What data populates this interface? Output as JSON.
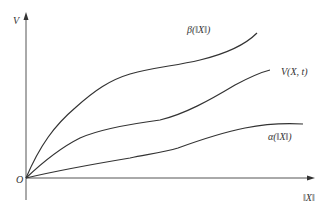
{
  "diagram": {
    "axes": {
      "y_label": "V",
      "x_label": "‖X‖",
      "origin_label": "O"
    },
    "curves": [
      {
        "name": "beta",
        "label": "β(‖X‖)",
        "description": "upper bound, concave curve rising fastest"
      },
      {
        "name": "lyapunov",
        "label": "V(X, t)",
        "description": "middle curve"
      },
      {
        "name": "alpha",
        "label": "α(‖X‖)",
        "description": "lower bound, flattening curve"
      }
    ],
    "colors": {
      "line": "#333333",
      "axis": "#555555",
      "background": "#ffffff"
    }
  }
}
